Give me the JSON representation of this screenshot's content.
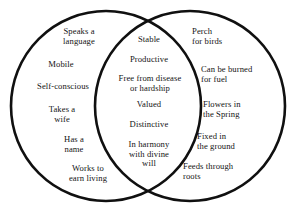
{
  "diagram": {
    "type": "venn-two-set",
    "background_color": "#ffffff",
    "stroke_color": "#101010",
    "text_color": "#141414",
    "left_set": {
      "name": "left-circle",
      "items": [
        {
          "text": "Speaks a\nlanguage",
          "x": 48,
          "y": 27,
          "w": 62
        },
        {
          "text": "Mobile",
          "x": 32,
          "y": 60,
          "w": 58
        },
        {
          "text": "Self-conscious",
          "x": 22,
          "y": 82,
          "w": 82
        },
        {
          "text": "Takes a\nwife",
          "x": 33,
          "y": 105,
          "w": 58
        },
        {
          "text": "Has a\nname",
          "x": 45,
          "y": 135,
          "w": 58
        },
        {
          "text": "Works to\nearn living",
          "x": 55,
          "y": 164,
          "w": 66
        }
      ]
    },
    "intersection": {
      "name": "intersection-lens",
      "items": [
        {
          "text": "Stable",
          "x": 118,
          "y": 35,
          "w": 62
        },
        {
          "text": "Productive",
          "x": 112,
          "y": 55,
          "w": 74
        },
        {
          "text": "Free from disease\nor hardship",
          "x": 106,
          "y": 74,
          "w": 88
        },
        {
          "text": "Valued",
          "x": 118,
          "y": 100,
          "w": 62
        },
        {
          "text": "Distinctive",
          "x": 114,
          "y": 120,
          "w": 70
        },
        {
          "text": "In harmony\nwith divine\nwill",
          "x": 114,
          "y": 140,
          "w": 70
        }
      ]
    },
    "right_set": {
      "name": "right-circle",
      "items": [
        {
          "text": "Perch\nfor birds",
          "x": 192,
          "y": 27,
          "w": 70
        },
        {
          "text": "Can be burned\nfor fuel",
          "x": 201,
          "y": 65,
          "w": 82
        },
        {
          "text": "Flowers in\nthe Spring",
          "x": 203,
          "y": 100,
          "w": 72
        },
        {
          "text": "Fixed in\nthe ground",
          "x": 197,
          "y": 132,
          "w": 72
        },
        {
          "text": "Feeds through\nroots",
          "x": 183,
          "y": 162,
          "w": 82
        }
      ]
    }
  }
}
